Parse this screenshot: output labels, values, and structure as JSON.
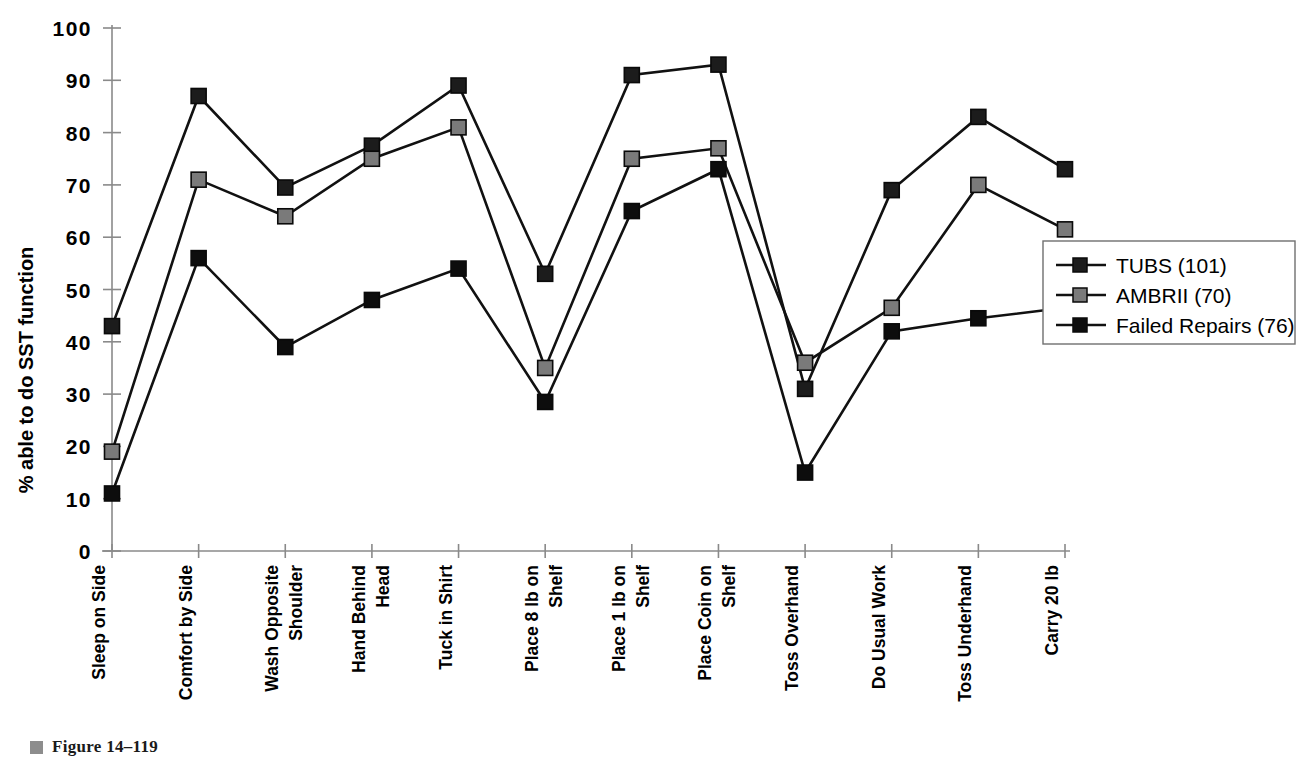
{
  "figure": {
    "caption_bullet": "gray-square-bullet",
    "caption": "Figure 14–119"
  },
  "chart_data": {
    "type": "line",
    "title": "",
    "xlabel": "",
    "ylabel": "% able to do SST function",
    "ylim": [
      0,
      100
    ],
    "yticks": [
      0,
      10,
      20,
      30,
      40,
      50,
      60,
      70,
      80,
      90,
      100
    ],
    "grid": false,
    "legend_position": "right",
    "categories": [
      "Sleep on Side",
      "Comfort by Side",
      "Wash Opposite Shoulder",
      "Hand Behind Head",
      "Tuck in Shirt",
      "Place 8 lb on Shelf",
      "Place 1 lb on Shelf",
      "Place Coin on Shelf",
      "Toss Overhand",
      "Do Usual Work",
      "Toss Underhand",
      "Carry 20 lb"
    ],
    "series": [
      {
        "name": "TUBS (101)",
        "color": "#1c1c1c",
        "marker": "square",
        "values": [
          43,
          87,
          69.5,
          77.5,
          89,
          53,
          91,
          93,
          31,
          69,
          83,
          73
        ]
      },
      {
        "name": "AMBRII (70)",
        "color": "#7a7a7a",
        "marker": "square",
        "values": [
          19,
          71,
          64,
          75,
          81,
          35,
          75,
          77,
          36,
          46.5,
          70,
          61.5
        ]
      },
      {
        "name": "Failed Repairs (76)",
        "color": "#0d0d0d",
        "marker": "square",
        "values": [
          11,
          56,
          39,
          48,
          54,
          28.5,
          65,
          73,
          15,
          42,
          44.5,
          46.5
        ]
      }
    ]
  },
  "legend": {
    "entries": [
      "TUBS (101)",
      "AMBRII (70)",
      "Failed Repairs (76)"
    ]
  }
}
